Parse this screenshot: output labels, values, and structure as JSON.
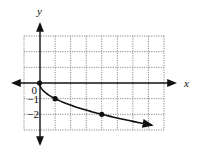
{
  "chart_data": {
    "type": "line",
    "title": "",
    "function": "y = -sqrt(x)",
    "xlabel": "x",
    "ylabel": "y",
    "xlim": [
      -1,
      8
    ],
    "ylim": [
      -3,
      3
    ],
    "grid": true,
    "grid_style": "dashed",
    "tick_labels": {
      "y": [
        "0",
        "−1",
        "−2"
      ]
    },
    "series": [
      {
        "name": "y = -√x",
        "x": [
          0,
          0.25,
          0.5,
          1,
          2,
          3,
          4,
          5,
          6,
          7,
          7.2
        ],
        "y": [
          0,
          -0.5,
          -0.71,
          -1,
          -1.41,
          -1.73,
          -2,
          -2.24,
          -2.45,
          -2.65,
          -2.68
        ],
        "end_arrow": true
      }
    ],
    "marked_points": [
      {
        "x": 0,
        "y": 0
      },
      {
        "x": 1,
        "y": -1
      },
      {
        "x": 4,
        "y": -2
      }
    ],
    "legend": null
  },
  "labels": {
    "x_axis": "x",
    "y_axis": "y",
    "origin": "0",
    "neg1": "−1",
    "neg2": "−2"
  }
}
